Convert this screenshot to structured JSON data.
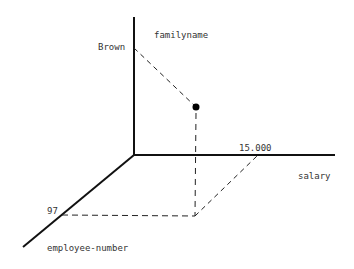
{
  "diagram": {
    "type": "3d-axes-point",
    "axes": {
      "vertical": {
        "label": "familyname",
        "tick_label": "Brown"
      },
      "horizontal": {
        "label": "salary",
        "tick_label": "15.000"
      },
      "depth": {
        "label": "employee-number",
        "tick_label": "97"
      }
    },
    "point": {
      "familyname": "Brown",
      "salary": "15.000",
      "employee_number": "97"
    },
    "colors": {
      "line": "#111111",
      "text": "#333333",
      "background": "#ffffff"
    }
  }
}
